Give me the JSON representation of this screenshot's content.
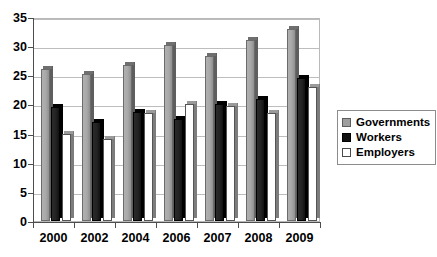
{
  "chart_data": {
    "type": "bar",
    "title": "",
    "subtitle": "",
    "xlabel": "",
    "ylabel": "",
    "categories": [
      "2000",
      "2002",
      "2004",
      "2006",
      "2007",
      "2008",
      "2009"
    ],
    "series": [
      {
        "name": "Governments",
        "color": "#9e9e9e",
        "values": [
          26.0,
          25.2,
          26.7,
          30.2,
          28.3,
          31.0,
          33.0
        ]
      },
      {
        "name": "Workers",
        "color": "#111111",
        "values": [
          19.6,
          17.0,
          18.7,
          17.5,
          20.0,
          21.0,
          24.5
        ]
      },
      {
        "name": "Employers",
        "color": "#ffffff",
        "values": [
          15.0,
          14.0,
          18.5,
          20.0,
          19.8,
          18.5,
          23.0
        ]
      }
    ],
    "ylim": [
      0,
      35
    ],
    "yticks": [
      0,
      5,
      10,
      15,
      20,
      25,
      30,
      35
    ],
    "ytick_labels": [
      "0",
      "5",
      "10",
      "15",
      "20",
      "25",
      "30",
      "35"
    ],
    "grid": true,
    "grid_axis": "y",
    "legend_position": "right",
    "background": "#ffffff",
    "frame_color": "#b9b9b9",
    "axis_color": "#4d4d4d"
  },
  "legend": {
    "items": [
      {
        "label": "Governments",
        "swatch": "governments-swatch"
      },
      {
        "label": "Workers",
        "swatch": "workers-swatch"
      },
      {
        "label": "Employers",
        "swatch": "employers-swatch"
      }
    ]
  }
}
